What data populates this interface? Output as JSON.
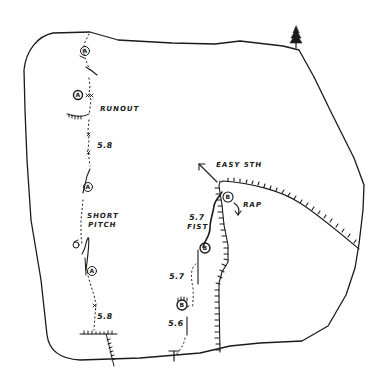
{
  "topo": {
    "type": "climbing-route-topo",
    "stroke_color": "#1a1a1a",
    "background": "#ffffff",
    "labels": {
      "runout": "RUNOUT",
      "grade_upper_left": "5.8",
      "short_pitch_line1": "SHORT",
      "short_pitch_line2": "PITCH",
      "grade_lower_left": "5.8",
      "easy_5th": "EASY 5TH",
      "rap": "RAP",
      "grade_fist": "5.7",
      "fist": "FIST",
      "grade_middle": "5.7",
      "grade_start": "5.6"
    },
    "anchors": {
      "route_a": [
        "A",
        "A",
        "A",
        "A"
      ],
      "route_b": [
        "B",
        "B",
        "B"
      ]
    },
    "icons": [
      "tree-icon",
      "arrow-icon",
      "rappel-arrow-icon",
      "piton-icon"
    ]
  }
}
